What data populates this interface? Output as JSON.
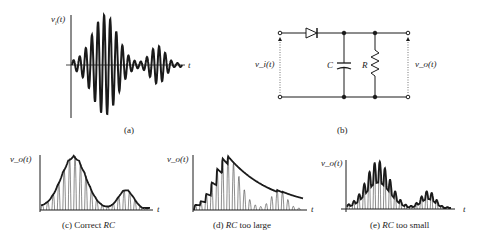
{
  "panel_a": {
    "y_label": "v_i(t)",
    "y_label_base": "v",
    "y_label_sub": "i",
    "y_label_arg": "(t)",
    "x_label": "t",
    "caption": "(a)"
  },
  "panel_b": {
    "input_label": "v_i(t)",
    "output_label": "v_o(t)",
    "capacitor_label": "C",
    "resistor_label": "R",
    "caption": "(b)",
    "components": [
      "diode",
      "capacitor C",
      "resistor R"
    ]
  },
  "panel_c": {
    "y_label": "v_o(t)",
    "x_label": "t",
    "caption_prefix": "(c) Correct ",
    "caption_italic": "RC"
  },
  "panel_d": {
    "y_label": "v_o(t)",
    "x_label": "t",
    "caption_prefix": "(d) ",
    "caption_italic": "RC",
    "caption_suffix": " too large"
  },
  "panel_e": {
    "y_label": "v_o(t)",
    "x_label": "t",
    "caption_prefix": "(e) ",
    "caption_italic": "RC",
    "caption_suffix": " too small"
  },
  "colors": {
    "ink": "#1a1a1a",
    "background": "#ffffff"
  }
}
